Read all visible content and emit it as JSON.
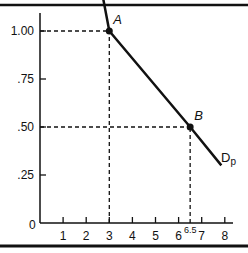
{
  "chart_data": {
    "type": "line",
    "title": "",
    "xlabel": "",
    "ylabel": "",
    "xlim": [
      0,
      8.3
    ],
    "ylim": [
      0,
      1.15
    ],
    "grid": false,
    "x_ticks": [
      1,
      2,
      3,
      4,
      5,
      6,
      6.5,
      7,
      8
    ],
    "x_tick_labels": [
      "1",
      "2",
      "3",
      "4",
      "5",
      "6",
      "6.5",
      "7",
      "8"
    ],
    "y_ticks": [
      0,
      0.25,
      0.5,
      0.75,
      1.0
    ],
    "y_tick_labels": [
      "0",
      ".25",
      ".50",
      ".75",
      "1.00"
    ],
    "origin_label": "0",
    "series": [
      {
        "name": "Dp",
        "label": "D",
        "label_subscript": "p",
        "x": [
          2.45,
          3,
          6.5,
          7.85
        ],
        "y": [
          1.35,
          1.0,
          0.5,
          0.3
        ]
      }
    ],
    "points": [
      {
        "name": "A",
        "label": "A",
        "x": 3,
        "y": 1.0
      },
      {
        "name": "B",
        "label": "B",
        "x": 6.5,
        "y": 0.5
      }
    ],
    "guides": [
      {
        "type": "dashed",
        "from": [
          0,
          1.0
        ],
        "to": [
          3,
          1.0
        ]
      },
      {
        "type": "dashed",
        "from": [
          3,
          0
        ],
        "to": [
          3,
          1.0
        ]
      },
      {
        "type": "dashed",
        "from": [
          0,
          0.5
        ],
        "to": [
          6.5,
          0.5
        ]
      },
      {
        "type": "dashed",
        "from": [
          6.5,
          0
        ],
        "to": [
          6.5,
          0.5
        ]
      }
    ],
    "legend_position": "none"
  },
  "colors": {
    "ink": "#111111",
    "background": "#ffffff"
  }
}
